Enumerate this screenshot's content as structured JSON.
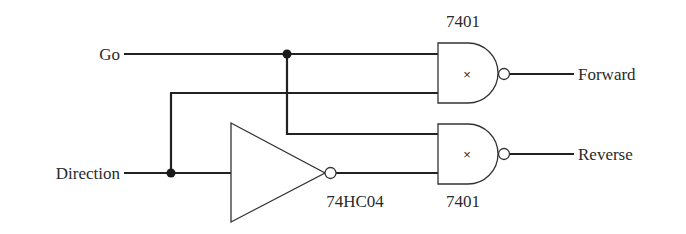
{
  "diagram": {
    "type": "logic-circuit",
    "inputs": {
      "go": "Go",
      "direction": "Direction"
    },
    "outputs": {
      "forward": "Forward",
      "reverse": "Reverse"
    },
    "components": {
      "gate_top": {
        "part": "7401",
        "symbol": "×",
        "kind": "NAND (open-collector)"
      },
      "gate_bottom": {
        "part": "7401",
        "symbol": "×",
        "kind": "NAND (open-collector)"
      },
      "inverter": {
        "part": "74HC04",
        "kind": "NOT"
      }
    },
    "colors": {
      "line": "#222222",
      "text": "#2a2a2a",
      "background": "#ffffff"
    }
  }
}
